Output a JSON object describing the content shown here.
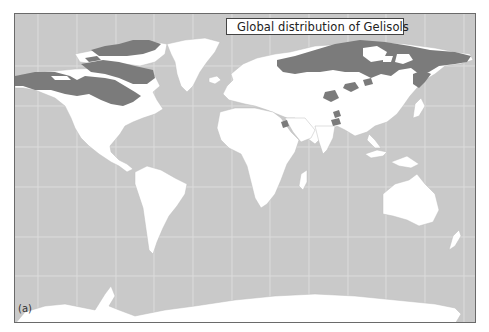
{
  "figure": {
    "panel_label": "(a)",
    "legend": {
      "label": "Global distribution of Gelisols",
      "swatch_color": "#7b7b7b"
    },
    "colors": {
      "ocean": "#c9c9c9",
      "land": "#ffffff",
      "gelisols": "#7b7b7b",
      "gridline": "#dcdcdc",
      "border": "#6a6a6a"
    }
  }
}
